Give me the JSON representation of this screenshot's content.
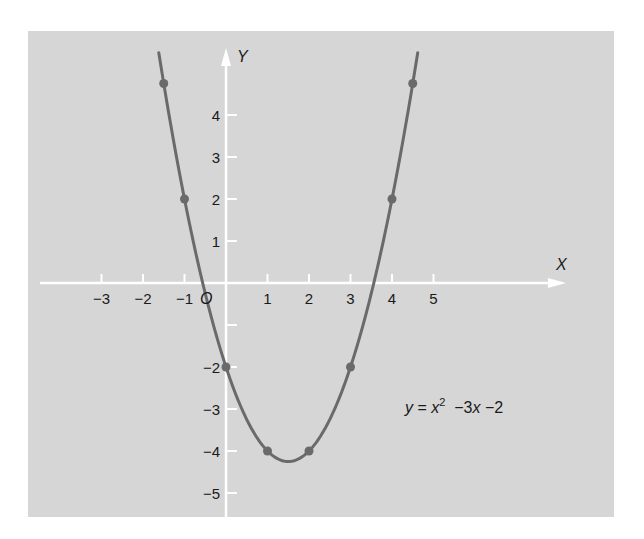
{
  "chart_data": {
    "type": "line",
    "title": "",
    "equation": {
      "lhs": "y",
      "eq": " = ",
      "x": "x",
      "exp": "2",
      "rest_a": "  −3",
      "rest_x": "x",
      "rest_b": " −2"
    },
    "function": "y = x^2 - 3x - 2",
    "xlabel": "X",
    "ylabel": "Y",
    "origin_label": "O",
    "xlim": [
      -4.5,
      8.1
    ],
    "ylim": [
      -5.6,
      5.8
    ],
    "x_ticks": [
      -3,
      -2,
      -1,
      0,
      1,
      2,
      3,
      4,
      5
    ],
    "x_tick_labels": [
      "−3",
      "−2",
      "−1",
      "",
      "1",
      "2",
      "3",
      "4",
      "5"
    ],
    "y_ticks": [
      4,
      3,
      2,
      1,
      -1,
      -2,
      -3,
      -4,
      -5
    ],
    "y_tick_labels": [
      "4",
      "3",
      "2",
      "1",
      "",
      "−2",
      "−3",
      "−4",
      "−5"
    ],
    "grid": false,
    "series": [
      {
        "name": "y = x² − 3x − 2",
        "curve_x_range": [
          -1.62,
          4.62
        ],
        "points": [
          {
            "x": -1.5,
            "y": 4.75
          },
          {
            "x": -1,
            "y": 2
          },
          {
            "x": 0,
            "y": -2
          },
          {
            "x": 1,
            "y": -4
          },
          {
            "x": 2,
            "y": -4
          },
          {
            "x": 3,
            "y": -2
          },
          {
            "x": 4,
            "y": 2
          },
          {
            "x": 4.5,
            "y": 4.75
          }
        ]
      }
    ]
  },
  "colors": {
    "panel_bg": "#d6d6d6",
    "axis": "#ffffff",
    "curve": "#6a6a6a",
    "text": "#1a1a1a"
  },
  "layout": {
    "panel": {
      "x": 28,
      "y": 31,
      "w": 586,
      "h": 486
    },
    "origin_px": {
      "x": 226,
      "y": 283
    },
    "scale_px": {
      "x": 41.5,
      "y": 42
    },
    "x_axis_px": {
      "x1": 40,
      "x2": 566
    },
    "y_axis_px": {
      "y_top": 48,
      "y_bottom": 518
    }
  }
}
